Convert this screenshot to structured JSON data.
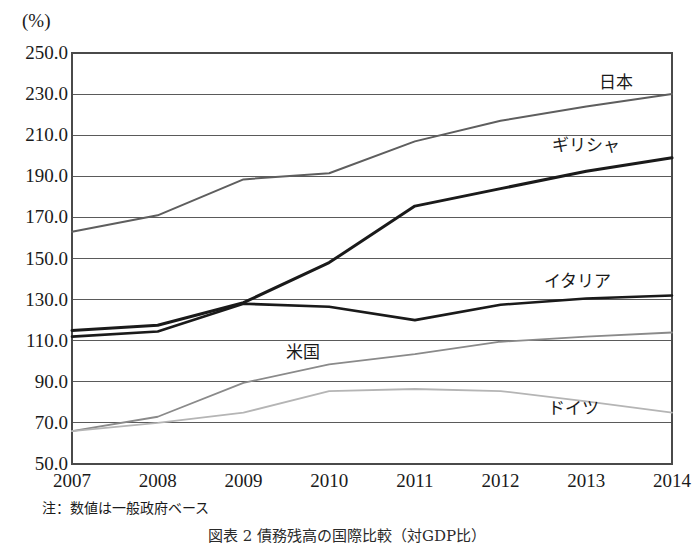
{
  "figure": {
    "unit_label": "(%)",
    "note": "注：数値は一般政府ベース",
    "caption": "図表 2  債務残高の国際比較（対GDP比）"
  },
  "chart_data": {
    "type": "line",
    "title": "",
    "subtitle": "",
    "xlabel": "",
    "ylabel": "(%)",
    "ylim": [
      50.0,
      250.0
    ],
    "ytick_step": 20.0,
    "ytick_labels": [
      "250.0",
      "230.0",
      "210.0",
      "190.0",
      "170.0",
      "150.0",
      "130.0",
      "110.0",
      "90.0",
      "70.0",
      "50.0"
    ],
    "ytick_values": [
      250.0,
      230.0,
      210.0,
      190.0,
      170.0,
      150.0,
      130.0,
      110.0,
      90.0,
      70.0,
      50.0
    ],
    "grid": true,
    "grid_axis": "y",
    "legend_position": "inline-right",
    "categories": [
      "2007",
      "2008",
      "2009",
      "2010",
      "2011",
      "2012",
      "2013",
      "2014"
    ],
    "x": [
      2007,
      2008,
      2009,
      2010,
      2011,
      2012,
      2013,
      2014
    ],
    "series": [
      {
        "name": "日本",
        "color": "#5e5e5e",
        "width": 2.0,
        "label_x": 2013.35,
        "label_y": 237.0,
        "values": [
          163.0,
          171.0,
          188.5,
          191.5,
          207.0,
          217.0,
          224.0,
          230.0
        ]
      },
      {
        "name": "ギリシャ",
        "color": "#1a1a1a",
        "width": 3.0,
        "label_x": 2013.0,
        "label_y": 206.0,
        "values": [
          115.0,
          117.5,
          128.5,
          148.0,
          175.5,
          184.0,
          192.5,
          199.0
        ]
      },
      {
        "name": "イタリア",
        "color": "#1a1a1a",
        "width": 2.6,
        "label_x": 2012.9,
        "label_y": 140.0,
        "values": [
          112.0,
          114.5,
          128.0,
          126.5,
          120.0,
          127.5,
          130.5,
          132.0
        ]
      },
      {
        "name": "米国",
        "color": "#8a8a8a",
        "width": 1.8,
        "label_x": 2009.7,
        "label_y": 105.5,
        "values": [
          66.0,
          73.0,
          89.5,
          98.5,
          103.5,
          109.5,
          112.0,
          114.0
        ]
      },
      {
        "name": "ドイツ",
        "color": "#b5b5b5",
        "width": 1.8,
        "label_x": 2012.85,
        "label_y": 78.0,
        "values": [
          66.0,
          70.0,
          75.0,
          85.5,
          86.5,
          85.5,
          80.5,
          75.0
        ]
      }
    ]
  }
}
